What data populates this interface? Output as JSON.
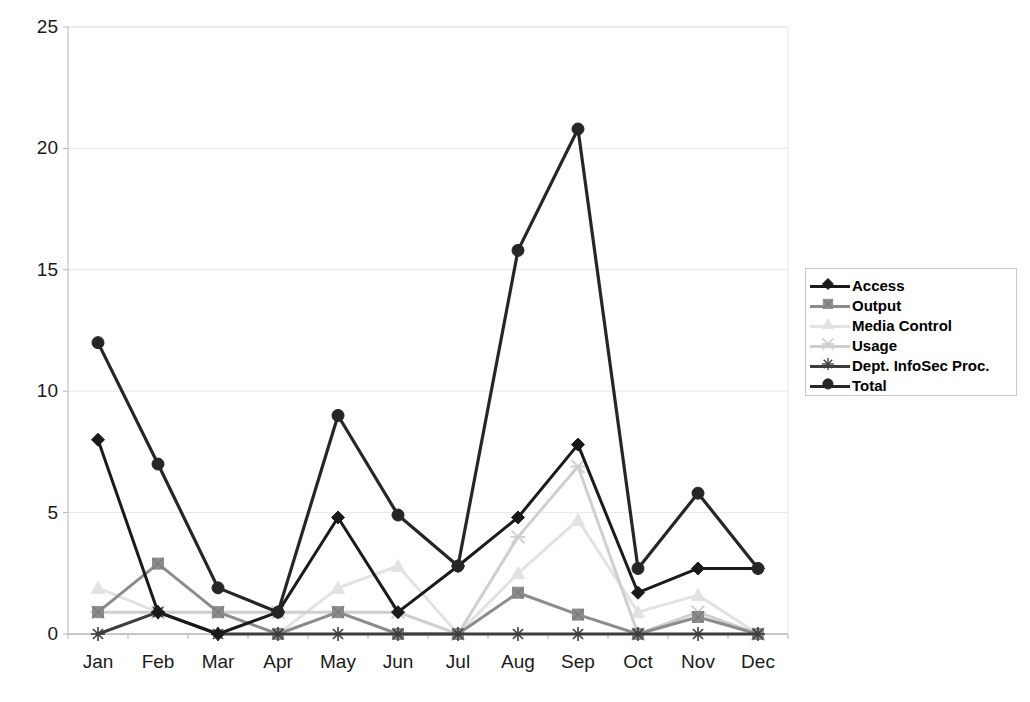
{
  "chart_data": {
    "type": "line",
    "title": "",
    "xlabel": "",
    "ylabel": "",
    "ylim": [
      0,
      25
    ],
    "yticks": [
      0,
      5,
      10,
      15,
      20,
      25
    ],
    "grid": true,
    "legend_position": "right",
    "categories": [
      "Jan",
      "Feb",
      "Mar",
      "Apr",
      "May",
      "Jun",
      "Jul",
      "Aug",
      "Sep",
      "Oct",
      "Nov",
      "Dec"
    ],
    "series": [
      {
        "name": "Access",
        "marker": "diamond",
        "color": "#1a1a1a",
        "values": [
          8.0,
          0.9,
          0.0,
          0.9,
          4.8,
          0.9,
          2.8,
          4.8,
          7.8,
          1.7,
          2.7,
          2.7
        ]
      },
      {
        "name": "Output",
        "marker": "square",
        "color": "#8c8c8c",
        "values": [
          0.9,
          2.9,
          0.9,
          0.0,
          0.9,
          0.0,
          0.0,
          1.7,
          0.8,
          0.0,
          0.7,
          0.0
        ]
      },
      {
        "name": "Media Control",
        "marker": "triangle",
        "color": "#e2e2e2",
        "values": [
          1.9,
          0.9,
          0.9,
          0.0,
          1.9,
          2.8,
          0.0,
          2.5,
          4.7,
          0.9,
          1.6,
          0.0
        ]
      },
      {
        "name": "Usage",
        "marker": "x-light",
        "color": "#cfcfcf",
        "values": [
          0.9,
          0.9,
          0.9,
          0.9,
          0.9,
          0.9,
          0.0,
          4.0,
          6.9,
          0.0,
          0.9,
          0.0
        ]
      },
      {
        "name": "Dept. InfoSec Proc.",
        "marker": "star",
        "color": "#3d3d3d",
        "values": [
          0.0,
          0.9,
          0.0,
          0.0,
          0.0,
          0.0,
          0.0,
          0.0,
          0.0,
          0.0,
          0.0,
          0.0
        ]
      },
      {
        "name": "Total",
        "marker": "circle",
        "color": "#262626",
        "values": [
          12.0,
          7.0,
          1.9,
          0.9,
          9.0,
          4.9,
          2.8,
          15.8,
          20.8,
          2.7,
          5.8,
          2.7
        ]
      }
    ]
  },
  "axis": {
    "y_ticks": [
      "0",
      "5",
      "10",
      "15",
      "20",
      "25"
    ],
    "x_ticks": [
      "Jan",
      "Feb",
      "Mar",
      "Apr",
      "May",
      "Jun",
      "Jul",
      "Aug",
      "Sep",
      "Oct",
      "Nov",
      "Dec"
    ]
  },
  "legend": {
    "entries": [
      {
        "label": "Access"
      },
      {
        "label": "Output"
      },
      {
        "label": "Media Control"
      },
      {
        "label": "Usage"
      },
      {
        "label": "Dept. InfoSec Proc."
      },
      {
        "label": "Total"
      }
    ]
  },
  "colors": {
    "access": "#1a1a1a",
    "output": "#8c8c8c",
    "media_control": "#e2e2e2",
    "usage": "#cfcfcf",
    "infosec": "#3d3d3d",
    "total": "#262626",
    "grid": "#e8e8e8",
    "axis": "#b5b5b5",
    "plot_background": "#ffffff"
  }
}
